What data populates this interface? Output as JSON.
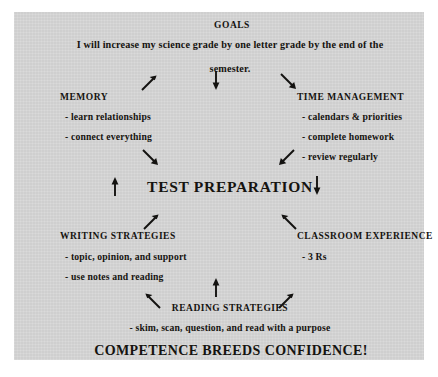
{
  "panel": {
    "background_color": "#d6d6d6",
    "page_background": "#ffffff",
    "text_color": "#15130f"
  },
  "goals": {
    "heading": "GOALS",
    "line1": "I will increase my science grade by one letter grade by the end of the",
    "line2": "semester."
  },
  "memory": {
    "heading": "MEMORY",
    "bullets": [
      "- learn relationships",
      "- connect everything"
    ]
  },
  "time_management": {
    "heading": "TIME MANAGEMENT",
    "bullets": [
      "- calendars & priorities",
      "- complete homework",
      "- review regularly"
    ]
  },
  "center": {
    "title": "TEST PREPARATION"
  },
  "writing_strategies": {
    "heading": "WRITING STRATEGIES",
    "bullets": [
      "- topic, opinion, and support",
      "- use notes and reading"
    ]
  },
  "classroom_experience": {
    "heading": "CLASSROOM EXPERIENCE",
    "bullets": [
      "- 3 Rs"
    ]
  },
  "reading_strategies": {
    "heading": "READING STRATEGIES",
    "bullets": [
      "- skim, scan, question, and read with a purpose"
    ]
  },
  "tagline": {
    "text": "COMPETENCE BREEDS CONFIDENCE!"
  },
  "arrows": [
    {
      "name": "arrow-goals-to-memory",
      "icon": "arrow-up-right-icon",
      "direction": "up-right"
    },
    {
      "name": "arrow-goals-down",
      "icon": "arrow-down-icon",
      "direction": "down"
    },
    {
      "name": "arrow-goals-to-time-management",
      "icon": "arrow-down-right-icon",
      "direction": "down-right"
    },
    {
      "name": "arrow-memory-to-center",
      "icon": "arrow-down-right-icon",
      "direction": "down-right"
    },
    {
      "name": "arrow-time-management-to-center",
      "icon": "arrow-down-left-icon",
      "direction": "down-left"
    },
    {
      "name": "arrow-left-up",
      "icon": "arrow-up-icon",
      "direction": "up"
    },
    {
      "name": "arrow-right-down",
      "icon": "arrow-down-icon",
      "direction": "down"
    },
    {
      "name": "arrow-center-to-writing",
      "icon": "arrow-up-right-icon",
      "direction": "up-right"
    },
    {
      "name": "arrow-center-to-classroom",
      "icon": "arrow-up-left-icon",
      "direction": "up-left"
    },
    {
      "name": "arrow-reading-up",
      "icon": "arrow-up-icon",
      "direction": "up"
    },
    {
      "name": "arrow-reading-to-writing",
      "icon": "arrow-up-left-icon",
      "direction": "up-left"
    },
    {
      "name": "arrow-reading-to-classroom",
      "icon": "arrow-up-right-icon",
      "direction": "up-right"
    }
  ]
}
